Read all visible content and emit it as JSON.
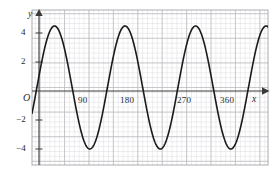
{
  "figure": {
    "background_color": "#ffffff",
    "curve_color": "#1a1a1a",
    "axis_color": "#3a3a3a",
    "major_grid_color": "#b9b9bd",
    "minor_grid_color": "#dcdce0",
    "frame_color": "#9a9a9e"
  },
  "axes": {
    "x_axis_name": "x",
    "y_axis_name": "y",
    "origin_label": "O",
    "x_tick_labels": [
      "90",
      "180",
      "270",
      "360"
    ],
    "y_tick_labels": [
      "4",
      "2",
      "−2",
      "−4"
    ]
  },
  "chart_data": {
    "type": "line",
    "title": "",
    "subtitle": "",
    "xlabel": "x",
    "ylabel": "y",
    "legend": [],
    "legend_position": "none",
    "grid": true,
    "grid_major_step_x": 45,
    "grid_major_step_y": 2,
    "grid_minor_step_x": 9,
    "grid_minor_step_y": 0.4,
    "xlim": [
      -15,
      420
    ],
    "ylim": [
      -6.3,
      6.3
    ],
    "x_ticks": [
      90,
      180,
      270,
      360
    ],
    "y_ticks": [
      4,
      2,
      -2,
      -4
    ],
    "series": [
      {
        "name": "y = 5 sin(2.77x + 6)",
        "amplitude": 5,
        "period_degrees": 130,
        "phase_shift_degrees": 6,
        "vertical_shift": 0,
        "color": "#1a1a1a",
        "line_width": 1.6,
        "x": [
          0,
          9,
          18,
          27,
          36,
          45,
          54,
          63,
          72,
          81,
          90,
          99,
          108,
          117,
          126,
          135,
          144,
          153,
          162,
          171,
          180,
          189,
          198,
          207,
          216,
          225,
          234,
          243,
          252,
          261,
          270,
          279,
          288,
          297,
          306,
          315,
          324,
          333,
          342,
          351,
          360,
          369,
          378,
          387,
          396,
          405,
          414
        ],
        "y": [
          0.52,
          2.37,
          3.92,
          4.77,
          4.92,
          4.26,
          2.92,
          1.17,
          -0.78,
          -2.6,
          -4.06,
          -4.86,
          -4.9,
          -4.1,
          -2.74,
          -0.95,
          0.99,
          2.77,
          4.11,
          4.87,
          4.89,
          4.13,
          2.72,
          0.94,
          -1.0,
          -2.78,
          -4.12,
          -4.88,
          -4.88,
          -4.12,
          -2.73,
          -0.93,
          1.02,
          2.79,
          4.13,
          4.88,
          4.87,
          4.11,
          2.7,
          0.9,
          -1.04,
          -2.81,
          -4.14,
          -4.89,
          -4.87,
          -4.09,
          -2.68
        ]
      }
    ],
    "key_points": {
      "maxima_y": 5,
      "minima_y": -5,
      "y_at_x_zero": 0.52,
      "peaks_x": [
        26,
        156,
        286,
        416
      ],
      "troughs_x": [
        91,
        221,
        351
      ]
    }
  }
}
